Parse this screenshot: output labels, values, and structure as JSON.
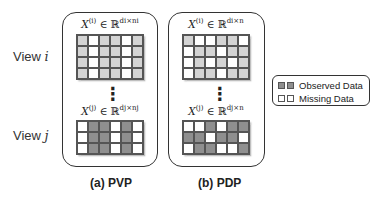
{
  "rows": {
    "view_i": {
      "label_prefix": "View ",
      "label_var": "i"
    },
    "view_j": {
      "label_prefix": "View ",
      "label_var": "j"
    }
  },
  "panels": [
    {
      "id": "pvp",
      "caption": "(a) PVP",
      "top_matrix": {
        "expr": "X",
        "sup": "(i)",
        "rel": " ∈ ℝ",
        "dims": "d_i×n_i",
        "dims_display": "di×ni"
      },
      "bottom_matrix": {
        "expr": "X",
        "sup": "(j)",
        "rel": " ∈ ℝ",
        "dims": "d_j×n_j",
        "dims_display": "dj×nj"
      },
      "top_grid": [
        [
          "l",
          "w",
          "l",
          "l",
          "w",
          "l"
        ],
        [
          "l",
          "w",
          "l",
          "l",
          "w",
          "l"
        ],
        [
          "l",
          "w",
          "l",
          "l",
          "w",
          "l"
        ],
        [
          "l",
          "w",
          "l",
          "l",
          "w",
          "l"
        ]
      ],
      "bottom_grid": [
        [
          "w",
          "d",
          "d",
          "w",
          "d",
          "w"
        ],
        [
          "w",
          "d",
          "d",
          "w",
          "d",
          "w"
        ],
        [
          "w",
          "d",
          "d",
          "w",
          "d",
          "w"
        ]
      ]
    },
    {
      "id": "pdp",
      "caption": "(b) PDP",
      "top_matrix": {
        "expr": "X",
        "sup": "(i)",
        "rel": " ∈ ℝ",
        "dims": "d_i×n",
        "dims_display": "di×n"
      },
      "bottom_matrix": {
        "expr": "X",
        "sup": "(j)",
        "rel": " ∈ ℝ",
        "dims": "d_j×n",
        "dims_display": "dj×n"
      },
      "top_grid": [
        [
          "l",
          "w",
          "w",
          "l",
          "l",
          "w"
        ],
        [
          "w",
          "l",
          "l",
          "w",
          "l",
          "l"
        ],
        [
          "w",
          "l",
          "w",
          "l",
          "w",
          "l"
        ],
        [
          "w",
          "l",
          "l",
          "w",
          "l",
          "l"
        ]
      ],
      "bottom_grid": [
        [
          "w",
          "w",
          "d",
          "w",
          "d",
          "d"
        ],
        [
          "d",
          "d",
          "w",
          "d",
          "d",
          "w"
        ],
        [
          "w",
          "d",
          "d",
          "w",
          "w",
          "d"
        ]
      ]
    }
  ],
  "ellipsis": "⋮",
  "legend": {
    "items": [
      {
        "label": "Observed Data",
        "swatches": [
          "#8f8f8f",
          "#8f8f8f"
        ]
      },
      {
        "label": "Missing Data",
        "swatches": [
          "#ffffff",
          "#ffffff"
        ]
      }
    ]
  },
  "colors": {
    "missing": "#ffffff",
    "observed_light": "#d4d4d4",
    "observed_dark": "#8f8f8f",
    "border": "#333333"
  }
}
